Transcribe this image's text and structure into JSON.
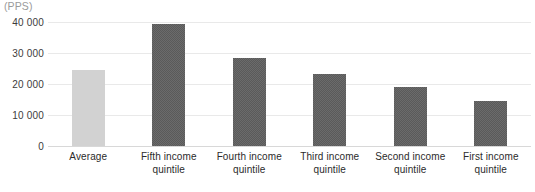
{
  "chart_data": {
    "type": "bar",
    "title": "",
    "subtitle": "",
    "xlabel": "",
    "ylabel": "",
    "unit_label": "(PPS)",
    "categories": [
      "Average",
      "Fifth income quintile",
      "Fourth income quintile",
      "Third income quintile",
      "Second income quintile",
      "First income quintile"
    ],
    "category_lines": [
      [
        "Average"
      ],
      [
        "Fifth income",
        "quintile"
      ],
      [
        "Fourth income",
        "quintile"
      ],
      [
        "Third income",
        "quintile"
      ],
      [
        "Second income",
        "quintile"
      ],
      [
        "First income",
        "quintile"
      ]
    ],
    "values": [
      24500,
      39500,
      28400,
      23200,
      19000,
      14500
    ],
    "ylim": [
      0,
      40000
    ],
    "yticks": [
      0,
      10000,
      20000,
      30000,
      40000
    ],
    "ytick_labels": [
      "0",
      "10 000",
      "20 000",
      "30 000",
      "40 000"
    ],
    "grid": true,
    "legend": false,
    "colors": {
      "average_bar": "#d2d2d2",
      "quintile_bar": "#5a5a5a",
      "gridline": "#e9e9e9",
      "baseline": "#d8d8d8",
      "tick_text": "#3c3c3c",
      "category_text": "#2b2b2b",
      "unit_text": "#9a9a9a"
    },
    "bar_styles": [
      "light",
      "dark",
      "dark",
      "dark",
      "dark",
      "dark"
    ]
  }
}
